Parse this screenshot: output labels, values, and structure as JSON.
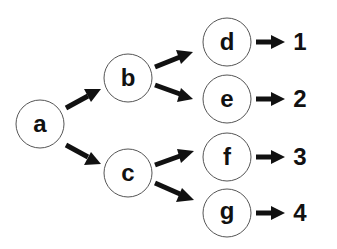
{
  "diagram": {
    "type": "tree",
    "nodes": [
      {
        "id": "a",
        "label": "a",
        "cx": 40,
        "cy": 124
      },
      {
        "id": "b",
        "label": "b",
        "cx": 128,
        "cy": 78
      },
      {
        "id": "c",
        "label": "c",
        "cx": 128,
        "cy": 173
      },
      {
        "id": "d",
        "label": "d",
        "cx": 227,
        "cy": 42
      },
      {
        "id": "e",
        "label": "e",
        "cx": 227,
        "cy": 99
      },
      {
        "id": "f",
        "label": "f",
        "cx": 227,
        "cy": 157
      },
      {
        "id": "g",
        "label": "g",
        "cx": 227,
        "cy": 213
      }
    ],
    "edges": [
      {
        "from": "a",
        "to": "b"
      },
      {
        "from": "a",
        "to": "c"
      },
      {
        "from": "b",
        "to": "d"
      },
      {
        "from": "b",
        "to": "e"
      },
      {
        "from": "c",
        "to": "f"
      },
      {
        "from": "c",
        "to": "g"
      }
    ],
    "outputs": [
      {
        "from": "d",
        "value": "1"
      },
      {
        "from": "e",
        "value": "2"
      },
      {
        "from": "f",
        "value": "3"
      },
      {
        "from": "g",
        "value": "4"
      }
    ],
    "colors": {
      "stroke": "#555555",
      "arrow": "#111111",
      "text": "#111111"
    }
  }
}
